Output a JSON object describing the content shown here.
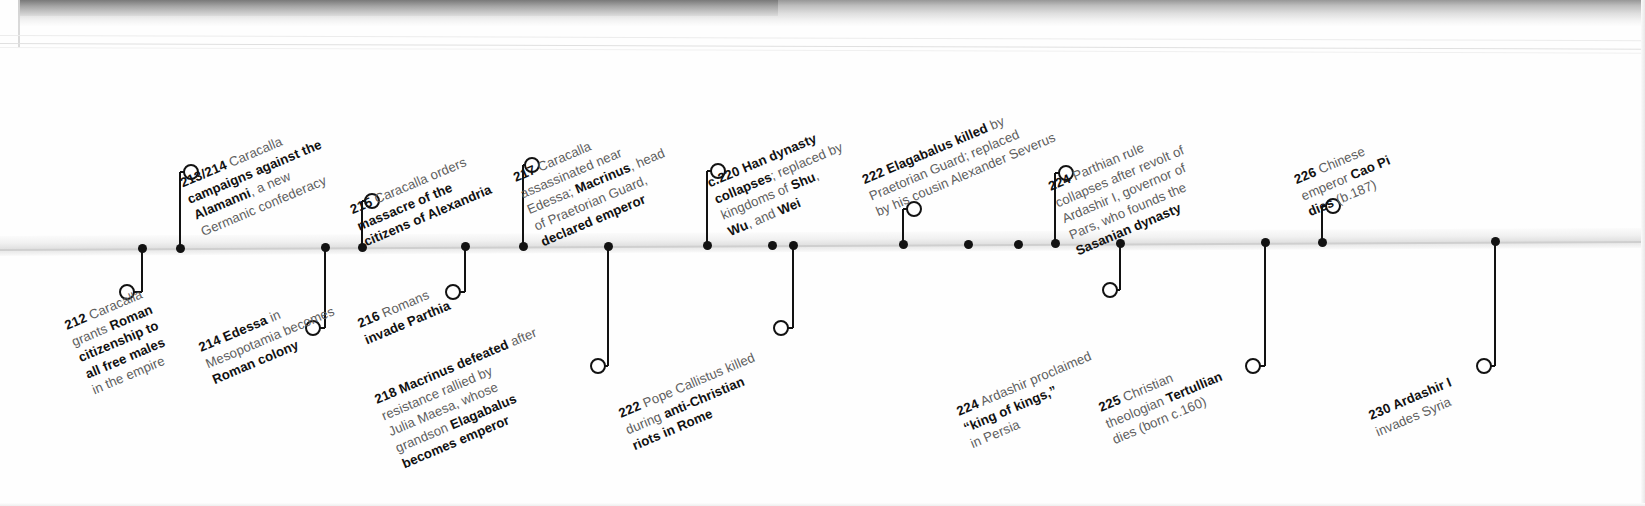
{
  "page": {
    "kind": "printed-timeline-scan",
    "axis_label": "",
    "ink_color": "#111111",
    "muted_color": "#5d5d5d",
    "axis_color": "#cfcfcf"
  },
  "timeline": {
    "events": [
      {
        "id": "e212",
        "year": "212",
        "side": "below",
        "axis_x": 142,
        "ring_x": 127,
        "ring_y": 292,
        "label_x": 62,
        "label_y": 318,
        "lines": [
          [
            {
              "t": "212",
              "s": "year"
            },
            {
              "t": " Caracalla",
              "s": "light"
            }
          ],
          [
            {
              "t": "grants ",
              "s": "light"
            },
            {
              "t": "Roman",
              "s": "bold"
            }
          ],
          [
            {
              "t": "citizenship to",
              "s": "bold"
            }
          ],
          [
            {
              "t": "all free males",
              "s": "bold"
            }
          ],
          [
            {
              "t": "in the empire",
              "s": "light"
            }
          ]
        ]
      },
      {
        "id": "e213",
        "year": "213/214",
        "side": "above",
        "axis_x": 180,
        "ring_x": 191,
        "ring_y": 172,
        "label_x": 205,
        "label_y": 170,
        "lines": [
          [
            {
              "t": "213/214",
              "s": "year"
            },
            {
              "t": " Caracalla",
              "s": "light"
            }
          ],
          [
            {
              "t": "campaigns against the",
              "s": "bold"
            }
          ],
          [
            {
              "t": "Alamanni",
              "s": "bold"
            },
            {
              "t": ", a new",
              "s": "light"
            }
          ],
          [
            {
              "t": "Germanic confederacy",
              "s": "light"
            }
          ]
        ]
      },
      {
        "id": "e214",
        "year": "214",
        "side": "below",
        "axis_x": 325,
        "ring_x": 313,
        "ring_y": 328,
        "label_x": 196,
        "label_y": 340,
        "lines": [
          [
            {
              "t": "214",
              "s": "year"
            },
            {
              "t": " Edessa",
              "s": "bold"
            },
            {
              "t": " in",
              "s": "light"
            }
          ],
          [
            {
              "t": "Mesopotamia becomes",
              "s": "light"
            }
          ],
          [
            {
              "t": "Roman colony",
              "s": "bold"
            }
          ]
        ]
      },
      {
        "id": "e215",
        "year": "215",
        "side": "above",
        "axis_x": 362,
        "ring_x": 372,
        "ring_y": 201,
        "label_x": 368,
        "label_y": 198,
        "lines": [
          [
            {
              "t": "215",
              "s": "year"
            },
            {
              "t": " Caracalla orders",
              "s": "light"
            }
          ],
          [
            {
              "t": "massacre of the",
              "s": "bold"
            }
          ],
          [
            {
              "t": "citizens of Alexandria",
              "s": "bold"
            }
          ]
        ]
      },
      {
        "id": "e216",
        "year": "216",
        "side": "below",
        "axis_x": 465,
        "ring_x": 453,
        "ring_y": 292,
        "label_x": 355,
        "label_y": 316,
        "lines": [
          [
            {
              "t": "216",
              "s": "year"
            },
            {
              "t": " Romans",
              "s": "light"
            }
          ],
          [
            {
              "t": "invade Parthia",
              "s": "bold"
            }
          ]
        ]
      },
      {
        "id": "e217",
        "year": "217",
        "side": "above",
        "axis_x": 523,
        "ring_x": 532,
        "ring_y": 165,
        "label_x": 545,
        "label_y": 163,
        "lines": [
          [
            {
              "t": "217",
              "s": "year"
            },
            {
              "t": " Caracalla",
              "s": "light"
            }
          ],
          [
            {
              "t": "assassinated near",
              "s": "light"
            }
          ],
          [
            {
              "t": "Edessa; ",
              "s": "light"
            },
            {
              "t": "Macrinus",
              "s": "bold"
            },
            {
              "t": ", head",
              "s": "light"
            }
          ],
          [
            {
              "t": "of Praetorian Guard,",
              "s": "light"
            }
          ],
          [
            {
              "t": "declared emperor",
              "s": "bold"
            }
          ]
        ]
      },
      {
        "id": "e218",
        "year": "218",
        "side": "below",
        "axis_x": 608,
        "ring_x": 598,
        "ring_y": 366,
        "label_x": 372,
        "label_y": 392,
        "lines": [
          [
            {
              "t": "218",
              "s": "year"
            },
            {
              "t": " Macrinus defeated",
              "s": "bold"
            },
            {
              "t": " after",
              "s": "light"
            }
          ],
          [
            {
              "t": "resistance rallied by",
              "s": "light"
            }
          ],
          [
            {
              "t": "Julia Maesa, whose",
              "s": "light"
            }
          ],
          [
            {
              "t": "grandson ",
              "s": "light"
            },
            {
              "t": "Elagabalus",
              "s": "bold"
            }
          ],
          [
            {
              "t": "becomes emperor",
              "s": "bold"
            }
          ]
        ]
      },
      {
        "id": "e220",
        "year": "c.220",
        "side": "above",
        "axis_x": 707,
        "ring_x": 718,
        "ring_y": 171,
        "label_x": 732,
        "label_y": 170,
        "lines": [
          [
            {
              "t": "c.220",
              "s": "year"
            },
            {
              "t": " Han dynasty",
              "s": "bold"
            }
          ],
          [
            {
              "t": "collapses",
              "s": "bold"
            },
            {
              "t": "; replaced by",
              "s": "light"
            }
          ],
          [
            {
              "t": "kingdoms of ",
              "s": "light"
            },
            {
              "t": "Shu",
              "s": "bold"
            },
            {
              "t": ",",
              "s": "light"
            }
          ],
          [
            {
              "t": "Wu",
              "s": "bold"
            },
            {
              "t": ", and ",
              "s": "light"
            },
            {
              "t": "Wei",
              "s": "bold"
            }
          ]
        ]
      },
      {
        "id": "e222pope",
        "year": "222",
        "side": "below",
        "axis_x": 793,
        "ring_x": 781,
        "ring_y": 328,
        "label_x": 616,
        "label_y": 406,
        "lines": [
          [
            {
              "t": "222",
              "s": "year"
            },
            {
              "t": " Pope Callistus killed",
              "s": "light"
            }
          ],
          [
            {
              "t": "during ",
              "s": "light"
            },
            {
              "t": "anti-Christian",
              "s": "bold"
            }
          ],
          [
            {
              "t": "riots in Rome",
              "s": "bold"
            }
          ]
        ]
      },
      {
        "id": "e222elag",
        "year": "222",
        "side": "above",
        "axis_x": 903,
        "ring_x": 914,
        "ring_y": 209,
        "label_x": 880,
        "label_y": 168,
        "lines": [
          [
            {
              "t": "222",
              "s": "year"
            },
            {
              "t": " Elagabalus killed",
              "s": "bold"
            },
            {
              "t": " by",
              "s": "light"
            }
          ],
          [
            {
              "t": "Praetorian Guard; replaced",
              "s": "light"
            }
          ],
          [
            {
              "t": "by his cousin Alexander Severus",
              "s": "light"
            }
          ]
        ]
      },
      {
        "id": "e224ard",
        "year": "224",
        "side": "below",
        "axis_x": 1120,
        "ring_x": 1110,
        "ring_y": 290,
        "label_x": 954,
        "label_y": 404,
        "lines": [
          [
            {
              "t": "224",
              "s": "year"
            },
            {
              "t": " Ardashir proclaimed",
              "s": "light"
            }
          ],
          [
            {
              "t": "“king of kings,”",
              "s": "bold"
            }
          ],
          [
            {
              "t": "in Persia",
              "s": "light"
            }
          ]
        ]
      },
      {
        "id": "e224par",
        "axis_x": 1055,
        "year": "224",
        "side": "above",
        "ring_x": 1066,
        "ring_y": 173,
        "label_x": 1080,
        "label_y": 172,
        "lines": [
          [
            {
              "t": "224",
              "s": "year"
            },
            {
              "t": " Parthian rule",
              "s": "light"
            }
          ],
          [
            {
              "t": "collapses after revolt of",
              "s": "light"
            }
          ],
          [
            {
              "t": "Ardashir I, governor of",
              "s": "light"
            }
          ],
          [
            {
              "t": "Pars, who founds the",
              "s": "light"
            }
          ],
          [
            {
              "t": "Sasanian dynasty",
              "s": "bold"
            }
          ]
        ]
      },
      {
        "id": "e225",
        "year": "225",
        "side": "below",
        "axis_x": 1265,
        "ring_x": 1253,
        "ring_y": 366,
        "label_x": 1096,
        "label_y": 400,
        "lines": [
          [
            {
              "t": "225",
              "s": "year"
            },
            {
              "t": " Christian",
              "s": "light"
            }
          ],
          [
            {
              "t": "theologian ",
              "s": "light"
            },
            {
              "t": "Tertullian",
              "s": "bold"
            }
          ],
          [
            {
              "t": "dies (born c.160)",
              "s": "light"
            }
          ]
        ]
      },
      {
        "id": "e226",
        "year": "226",
        "side": "above",
        "axis_x": 1322,
        "ring_x": 1333,
        "ring_y": 206,
        "label_x": 1312,
        "label_y": 168,
        "lines": [
          [
            {
              "t": "226",
              "s": "year"
            },
            {
              "t": " Chinese",
              "s": "light"
            }
          ],
          [
            {
              "t": "emperor ",
              "s": "light"
            },
            {
              "t": "Cao Pi",
              "s": "bold"
            }
          ],
          [
            {
              "t": "dies",
              "s": "bold"
            },
            {
              "t": " (b.187)",
              "s": "light"
            }
          ]
        ]
      },
      {
        "id": "e230",
        "year": "230",
        "side": "below",
        "axis_x": 1495,
        "ring_x": 1484,
        "ring_y": 366,
        "label_x": 1366,
        "label_y": 408,
        "lines": [
          [
            {
              "t": "230",
              "s": "year"
            },
            {
              "t": " Ardashir I",
              "s": "bold"
            }
          ],
          [
            {
              "t": "invades Syria",
              "s": "light"
            }
          ]
        ]
      }
    ],
    "plain_markers": [
      {
        "axis_x": 772
      },
      {
        "axis_x": 968
      },
      {
        "axis_x": 1018
      }
    ]
  }
}
